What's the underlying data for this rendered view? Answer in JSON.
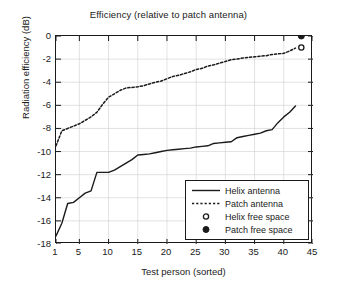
{
  "chart_data": {
    "type": "line",
    "title": "Efficiency (relative to patch antenna)",
    "xlabel": "Test person (sorted)",
    "ylabel": "Radiation efficiency (dB)",
    "xlim": [
      1,
      45
    ],
    "ylim": [
      -18,
      0
    ],
    "grid": true,
    "xticks": [
      1,
      5,
      10,
      15,
      20,
      25,
      30,
      35,
      40,
      45
    ],
    "xtick_labels": [
      "1",
      "5",
      "10",
      "15",
      "20",
      "25",
      "30",
      "35",
      "40",
      "45"
    ],
    "yticks": [
      0,
      -2,
      -4,
      -6,
      -8,
      -10,
      -12,
      -14,
      -16,
      -18
    ],
    "ytick_labels": [
      "0",
      "-2",
      "-4",
      "-6",
      "-8",
      "-10",
      "-12",
      "-14",
      "-16",
      "-18"
    ],
    "legend_position": "lower right",
    "series": [
      {
        "name": "Helix antenna",
        "style": "solid",
        "color": "#1a1a1a",
        "x": [
          1,
          2,
          3,
          4,
          5,
          6,
          7,
          8,
          9,
          10,
          11,
          12,
          13,
          14,
          15,
          16,
          17,
          18,
          19,
          20,
          21,
          22,
          23,
          24,
          25,
          26,
          27,
          28,
          29,
          30,
          31,
          32,
          33,
          34,
          35,
          36,
          37,
          38,
          39,
          40,
          41,
          42
        ],
        "values": [
          -17.3,
          -16.2,
          -14.5,
          -14.4,
          -14.0,
          -13.6,
          -13.4,
          -11.8,
          -11.8,
          -11.8,
          -11.6,
          -11.3,
          -11.0,
          -10.7,
          -10.3,
          -10.25,
          -10.2,
          -10.1,
          -10.0,
          -9.9,
          -9.85,
          -9.8,
          -9.75,
          -9.7,
          -9.6,
          -9.55,
          -9.5,
          -9.3,
          -9.25,
          -9.2,
          -9.15,
          -8.8,
          -8.7,
          -8.6,
          -8.5,
          -8.4,
          -8.2,
          -8.1,
          -7.5,
          -7.0,
          -6.6,
          -6.05
        ]
      },
      {
        "name": "Patch antenna",
        "style": "dotted",
        "color": "#1a1a1a",
        "x": [
          1,
          2,
          3,
          4,
          5,
          6,
          7,
          8,
          9,
          10,
          11,
          12,
          13,
          14,
          15,
          16,
          17,
          18,
          19,
          20,
          21,
          22,
          23,
          24,
          25,
          26,
          27,
          28,
          29,
          30,
          31,
          32,
          33,
          34,
          35,
          36,
          37,
          38,
          39,
          40,
          41,
          42
        ],
        "values": [
          -9.5,
          -8.2,
          -8.0,
          -7.8,
          -7.6,
          -7.3,
          -7.0,
          -6.6,
          -5.9,
          -5.3,
          -5.0,
          -4.7,
          -4.5,
          -4.45,
          -4.4,
          -4.3,
          -4.15,
          -4.0,
          -3.9,
          -3.7,
          -3.5,
          -3.4,
          -3.25,
          -3.1,
          -2.9,
          -2.8,
          -2.6,
          -2.5,
          -2.35,
          -2.2,
          -2.05,
          -2.0,
          -1.9,
          -1.85,
          -1.8,
          -1.75,
          -1.7,
          -1.6,
          -1.55,
          -1.5,
          -1.3,
          -1.05
        ]
      }
    ],
    "markers": [
      {
        "name": "Helix free space",
        "style": "open-circle",
        "x": 43,
        "y": -1.0
      },
      {
        "name": "Patch free space",
        "style": "filled-circle",
        "x": 43,
        "y": 0.0
      }
    ],
    "legend": [
      {
        "label": "Helix antenna",
        "symbol": "solid-line"
      },
      {
        "label": "Patch antenna",
        "symbol": "dotted-line"
      },
      {
        "label": "Helix free space",
        "symbol": "open-circle"
      },
      {
        "label": "Patch free space",
        "symbol": "filled-circle"
      }
    ]
  },
  "colors": {
    "axis": "#1a1a1a",
    "grid": "#cfcfcf",
    "background": "#ffffff"
  }
}
